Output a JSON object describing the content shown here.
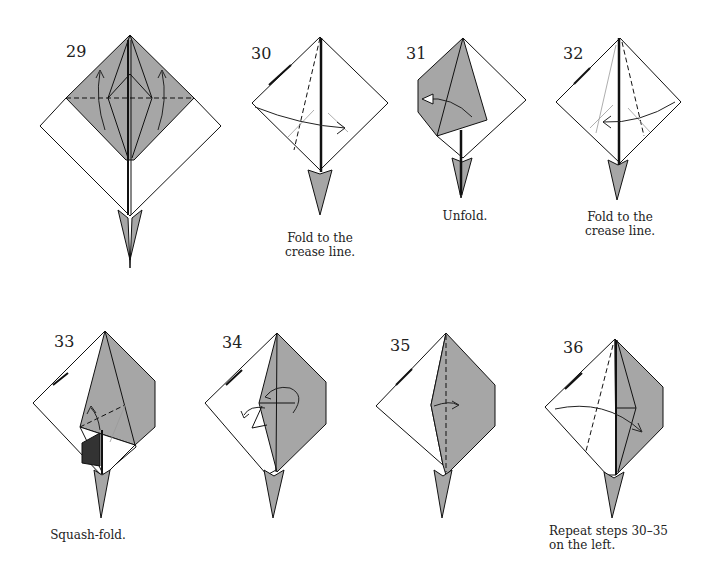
{
  "diagram": {
    "fill_color": "#a6a6a6",
    "steps": [
      {
        "number": "29",
        "caption": ""
      },
      {
        "number": "30",
        "caption": "Fold to the\ncrease line."
      },
      {
        "number": "31",
        "caption": "Unfold."
      },
      {
        "number": "32",
        "caption": "Fold to the\ncrease line."
      },
      {
        "number": "33",
        "caption": "Squash-fold."
      },
      {
        "number": "34",
        "caption": ""
      },
      {
        "number": "35",
        "caption": ""
      },
      {
        "number": "36",
        "caption": "Repeat steps 30–35\non the left."
      }
    ]
  }
}
